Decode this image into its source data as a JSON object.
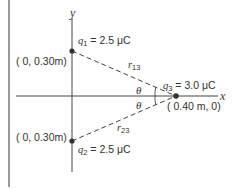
{
  "figure": {
    "axes": {
      "x_label": "x",
      "y_label": "y"
    },
    "charges": [
      {
        "name": "q1",
        "symbol": "q",
        "sub": "1",
        "value_text": "= 2.5 μC",
        "coord_text": "( 0, 0.30m)"
      },
      {
        "name": "q2",
        "symbol": "q",
        "sub": "2",
        "value_text": "= 2.5 μC",
        "coord_text": "( 0, 0.30m)"
      },
      {
        "name": "q3",
        "symbol": "q",
        "sub": "3",
        "value_text": "= 3.0 μC",
        "coord_text": "( 0.40 m, 0)"
      }
    ],
    "distances": [
      {
        "symbol": "r",
        "sub": "13"
      },
      {
        "symbol": "r",
        "sub": "23"
      }
    ],
    "angles": [
      {
        "symbol": "θ"
      },
      {
        "symbol": "θ"
      }
    ],
    "colors": {
      "line": "#444444",
      "text": "#333333",
      "dot": "#333333"
    }
  }
}
